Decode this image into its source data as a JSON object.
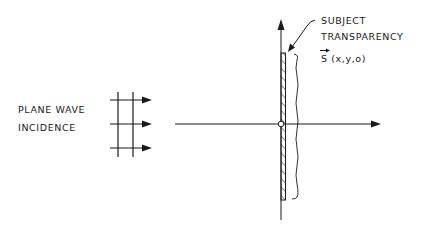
{
  "diagram": {
    "incidence_label": {
      "line1": "PLANE WAVE",
      "line2": "INCIDENCE"
    },
    "subject_label": {
      "line1": "SUBJECT",
      "line2": "TRANSPARENCY",
      "symbol": "S",
      "args": " (x,y,o)"
    },
    "colors": {
      "ink": "#1a1a1a",
      "background": "#ffffff"
    }
  }
}
